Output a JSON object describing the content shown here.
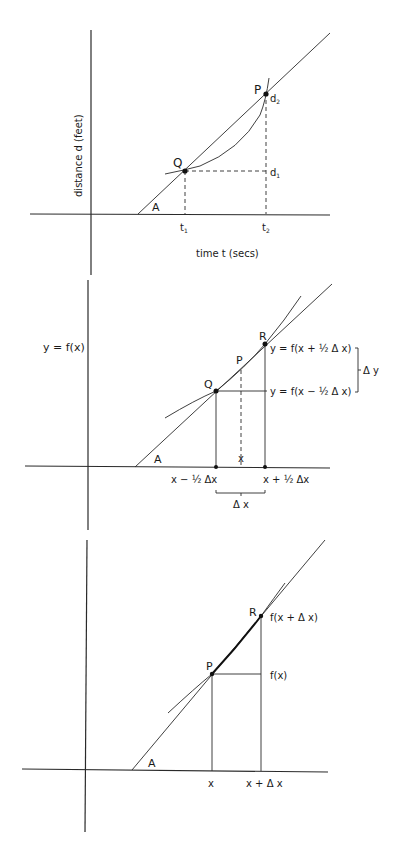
{
  "diagrams": [
    {
      "id": "distance-time",
      "ylabel": "distance  d  (feet)",
      "xlabel": "time  t  (secs)",
      "angle_label": "A",
      "points": {
        "Q": "Q",
        "P": "P"
      },
      "ticks": {
        "t1": "t",
        "t1_sub": "1",
        "t2": "t",
        "t2_sub": "2"
      },
      "levels": {
        "d1": "d",
        "d1_sub": "1",
        "d2": "d",
        "d2_sub": "2"
      }
    },
    {
      "id": "symmetric-difference",
      "function_label": "y = f(x)",
      "angle_label": "A",
      "points": {
        "Q": "Q",
        "P": "P",
        "R": "R"
      },
      "x_center_label": "x",
      "x_left_label": "x − ½ Δx",
      "x_right_label": "x + ½ Δx",
      "delta_x_label": "Δ x",
      "upper_value_label": "y = f(x + ½ Δ x)",
      "lower_value_label": "y = f(x − ½ Δ x)",
      "delta_y_label": "Δ y"
    },
    {
      "id": "forward-difference",
      "angle_label": "A",
      "points": {
        "P": "P",
        "R": "R"
      },
      "x_label": "x",
      "x_plus_label": "x + Δ x",
      "upper_value_label": "f(x + Δ x)",
      "lower_value_label": "f(x)"
    }
  ]
}
